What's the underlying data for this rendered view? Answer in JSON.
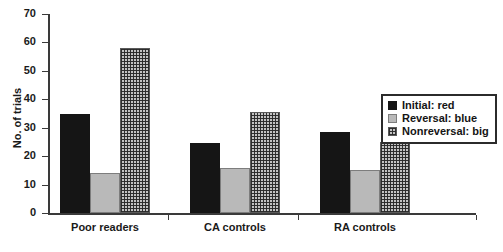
{
  "chart_data": {
    "type": "bar",
    "title": "",
    "xlabel": "",
    "ylabel": "No. of trials",
    "ylim": [
      0,
      70
    ],
    "ytick_step": 10,
    "yticks": [
      "70",
      "60",
      "50",
      "40",
      "30",
      "20",
      "10",
      "0"
    ],
    "grid": false,
    "legend_position": "right-middle",
    "categories": [
      "Poor readers",
      "CA controls",
      "RA controls"
    ],
    "series": [
      {
        "name": "Initial: red",
        "key": "initial",
        "color": "#151515",
        "values": [
          35,
          24.5,
          28.5
        ]
      },
      {
        "name": "Reversal: blue",
        "key": "reversal",
        "color": "#b9b9b9",
        "values": [
          14,
          16,
          15
        ]
      },
      {
        "name": "Nonreversal: big",
        "key": "nonreversal",
        "color": "#c3c3c3",
        "values": [
          58,
          35.5,
          25
        ]
      }
    ]
  },
  "axis": {
    "y_label": "No. of trials",
    "y_ticks": [
      {
        "value": 70,
        "label": "70"
      },
      {
        "value": 60,
        "label": "60"
      },
      {
        "value": 50,
        "label": "50"
      },
      {
        "value": 40,
        "label": "40"
      },
      {
        "value": 30,
        "label": "30"
      },
      {
        "value": 20,
        "label": "20"
      },
      {
        "value": 10,
        "label": "10"
      },
      {
        "value": 0,
        "label": "0"
      }
    ]
  },
  "categories": [
    {
      "label": "Poor readers"
    },
    {
      "label": "CA controls"
    },
    {
      "label": "RA controls"
    }
  ],
  "legend": {
    "items": [
      {
        "label": "Initial: red",
        "swatch": "initial"
      },
      {
        "label": "Reversal: blue",
        "swatch": "reversal"
      },
      {
        "label": "Nonreversal: big",
        "swatch": "nonreversal"
      }
    ]
  }
}
